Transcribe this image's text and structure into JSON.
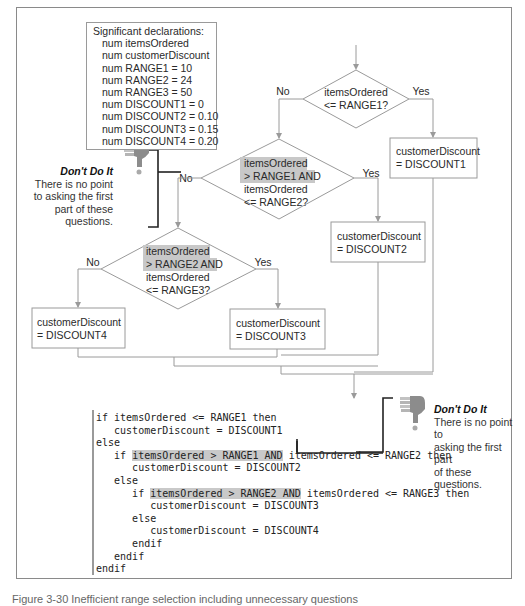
{
  "declarations": {
    "title": "Significant declarations:",
    "items": [
      "num itemsOrdered",
      "num customerDiscount",
      "num RANGE1 = 10",
      "num RANGE2 = 24",
      "num RANGE3 = 50",
      "num DISCOUNT1 = 0",
      "num DISCOUNT2 = 0.10",
      "num DISCOUNT3 = 0.15",
      "num DISCOUNT4 = 0.20"
    ]
  },
  "flowchart": {
    "decision1": {
      "line1": "itemsOrdered",
      "line2": "<= RANGE1?",
      "no": "No",
      "yes": "Yes"
    },
    "decision2": {
      "line1": "itemsOrdered",
      "line2": "> RANGE1 AND",
      "line3": "itemsOrdered",
      "line4": "<= RANGE2?",
      "no": "No",
      "yes": "Yes"
    },
    "decision3": {
      "line1": "itemsOrdered",
      "line2": "> RANGE2 AND",
      "line3": "itemsOrdered",
      "line4": "<= RANGE3?",
      "no": "No",
      "yes": "Yes"
    },
    "process1": {
      "line1": "customerDiscount",
      "line2": "= DISCOUNT1"
    },
    "process2": {
      "line1": "customerDiscount",
      "line2": "= DISCOUNT2"
    },
    "process3": {
      "line1": "customerDiscount",
      "line2": "= DISCOUNT3"
    },
    "process4": {
      "line1": "customerDiscount",
      "line2": "= DISCOUNT4"
    },
    "highlight_color": "#c8c8c8"
  },
  "notes": {
    "note1": {
      "icon": "thumbs-down-icon",
      "title": "Don't Do It",
      "body_lines": [
        "There is no point",
        "to asking the first",
        "part of these",
        "questions."
      ]
    },
    "note2": {
      "icon": "thumbs-down-icon",
      "title": "Don't Do It",
      "body_lines": [
        "There is no point to",
        "asking the first part",
        "of these questions."
      ]
    }
  },
  "pseudocode": {
    "lines": [
      {
        "indent": 0,
        "pre": "if itemsOrdered <= RANGE1 then",
        "hl": "",
        "post": ""
      },
      {
        "indent": 1,
        "pre": "customerDiscount = DISCOUNT1",
        "hl": "",
        "post": ""
      },
      {
        "indent": 0,
        "pre": "else",
        "hl": "",
        "post": ""
      },
      {
        "indent": 1,
        "pre": "if ",
        "hl": "itemsOrdered > RANGE1 AND",
        "post": " itemsOrdered <= RANGE2 then"
      },
      {
        "indent": 2,
        "pre": "customerDiscount = DISCOUNT2",
        "hl": "",
        "post": ""
      },
      {
        "indent": 1,
        "pre": "else",
        "hl": "",
        "post": ""
      },
      {
        "indent": 2,
        "pre": "if ",
        "hl": "itemsOrdered > RANGE2 AND",
        "post": " itemsOrdered <= RANGE3 then"
      },
      {
        "indent": 3,
        "pre": "customerDiscount = DISCOUNT3",
        "hl": "",
        "post": ""
      },
      {
        "indent": 2,
        "pre": "else",
        "hl": "",
        "post": ""
      },
      {
        "indent": 3,
        "pre": "customerDiscount = DISCOUNT4",
        "hl": "",
        "post": ""
      },
      {
        "indent": 2,
        "pre": "endif",
        "hl": "",
        "post": ""
      },
      {
        "indent": 1,
        "pre": "endif",
        "hl": "",
        "post": ""
      },
      {
        "indent": 0,
        "pre": "endif",
        "hl": "",
        "post": ""
      }
    ]
  },
  "caption": "Figure 3-30  Inefficient range selection including unnecessary questions"
}
